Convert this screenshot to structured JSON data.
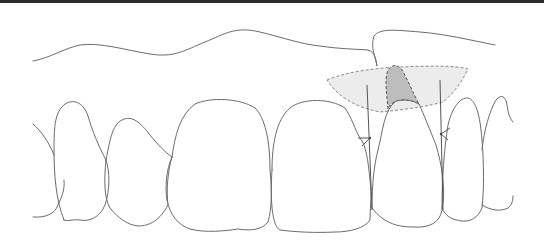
{
  "figure": {
    "colors": {
      "background": "#ffffff",
      "top_border": "#2a2a2a",
      "outline": "#6b6b6b",
      "light_shade": "#e9e9e9",
      "dark_shade": "#bdbdbd",
      "dashed": "#8a8a8a"
    },
    "elements": [
      "gingival-margin-line",
      "tooth-1",
      "tooth-2",
      "tooth-3-central-incisor",
      "tooth-4-central-incisor",
      "tooth-5-lateral-incisor",
      "tooth-6-canine",
      "tooth-7-partial",
      "graft-region-light",
      "graft-region-dark",
      "reference-line-left",
      "reference-line-right"
    ]
  }
}
